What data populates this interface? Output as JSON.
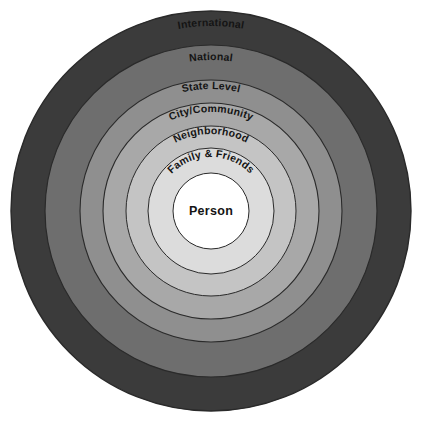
{
  "diagram": {
    "type": "concentric-rings",
    "center": {
      "x": 211,
      "y": 211
    },
    "background_color": "#ffffff",
    "outline_color": "#2a2a2a",
    "rings": [
      {
        "label": "International",
        "level": 7,
        "outer_radius": 200,
        "inner_radius": 166,
        "fill": "#3b3b3b",
        "label_color": "#141414",
        "label_font_size": 10.5,
        "label_arc_radius": 185
      },
      {
        "label": "National",
        "level": 6,
        "outer_radius": 166,
        "inner_radius": 131,
        "fill": "#6e6e6e",
        "label_color": "#141414",
        "label_font_size": 10.5,
        "label_arc_radius": 151
      },
      {
        "label": "State Level",
        "level": 5,
        "outer_radius": 131,
        "inner_radius": 108,
        "fill": "#8f8f8f",
        "label_color": "#141414",
        "label_font_size": 10.5,
        "label_arc_radius": 122
      },
      {
        "label": "City/Community",
        "level": 4,
        "outer_radius": 108,
        "inner_radius": 85,
        "fill": "#a8a8a8",
        "label_color": "#141414",
        "label_font_size": 10.5,
        "label_arc_radius": 99
      },
      {
        "label": "Neighborhood",
        "level": 3,
        "outer_radius": 85,
        "inner_radius": 63,
        "fill": "#c4c4c4",
        "label_color": "#141414",
        "label_font_size": 10.5,
        "label_arc_radius": 77
      },
      {
        "label": "Family & Friends",
        "level": 2,
        "outer_radius": 63,
        "inner_radius": 38,
        "fill": "#dcdcdc",
        "label_color": "#141414",
        "label_font_size": 10.5,
        "label_arc_radius": 54
      },
      {
        "label": "Person",
        "level": 1,
        "outer_radius": 38,
        "inner_radius": 0,
        "fill": "#ffffff",
        "label_color": "#141414",
        "label_font_size": 12.5,
        "label_arc_radius": 0
      }
    ]
  }
}
